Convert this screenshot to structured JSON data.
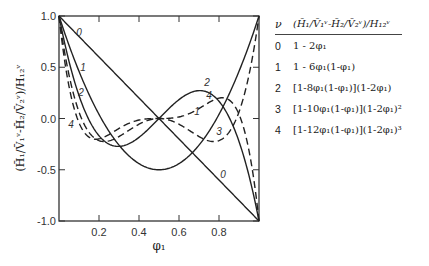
{
  "chart_data": {
    "type": "line",
    "title": "",
    "xlabel": "φ1",
    "ylabel": "(H̄1/V̄1^ν − H̄2/V̄2^ν)/H12^ν",
    "xlim": [
      0,
      1
    ],
    "ylim": [
      -1.0,
      1.0
    ],
    "x_ticks": [
      "0.2",
      "0.4",
      "0.6",
      "0.8"
    ],
    "y_ticks": [
      "1.0",
      "0.5",
      "0.0",
      "-0.5",
      "-1.0"
    ],
    "grid": false,
    "legend_position": "right (table)",
    "x": [
      0,
      0.05,
      0.1,
      0.15,
      0.2,
      0.25,
      0.3,
      0.35,
      0.4,
      0.45,
      0.5,
      0.55,
      0.6,
      0.65,
      0.7,
      0.75,
      0.8,
      0.85,
      0.9,
      0.95,
      1.0
    ],
    "series": [
      {
        "name": "0",
        "formula": "1 - 2φ1",
        "style": "solid",
        "values": [
          1.0,
          0.9,
          0.8,
          0.7,
          0.6,
          0.5,
          0.4,
          0.3,
          0.2,
          0.1,
          0.0,
          -0.1,
          -0.2,
          -0.3,
          -0.4,
          -0.5,
          -0.6,
          -0.7,
          -0.8,
          -0.9,
          -1.0
        ]
      },
      {
        "name": "1",
        "formula": "1 - 6φ1(1-φ1)",
        "style": "solid",
        "values": [
          1.0,
          0.715,
          0.46,
          0.235,
          0.04,
          -0.125,
          -0.26,
          -0.365,
          -0.44,
          -0.485,
          -0.5,
          -0.485,
          -0.44,
          -0.365,
          -0.26,
          -0.125,
          0.04,
          0.235,
          0.46,
          0.715,
          1.0
        ]
      },
      {
        "name": "2",
        "formula": "[1-8φ1(1-φ1)](1-2φ1)",
        "style": "solid",
        "values": [
          1.0,
          0.558,
          0.224,
          -0.014,
          -0.168,
          -0.25,
          -0.272,
          -0.246,
          -0.184,
          -0.098,
          0.0,
          0.098,
          0.184,
          0.246,
          0.272,
          0.25,
          0.168,
          0.014,
          -0.224,
          -0.558,
          -1.0
        ]
      },
      {
        "name": "3",
        "formula": "[1-10φ1(1-φ1)](1-2φ1)²",
        "style": "dashed",
        "values": [
          1.0,
          0.425,
          0.064,
          -0.134,
          -0.216,
          -0.219,
          -0.176,
          -0.111,
          -0.056,
          -0.012,
          0.0,
          -0.012,
          -0.056,
          -0.111,
          -0.176,
          -0.219,
          -0.216,
          -0.134,
          0.064,
          0.425,
          1.0
        ]
      },
      {
        "name": "4",
        "formula": "[1-12φ1(1-φ1)](1-2φ1)³",
        "style": "dashed",
        "values": [
          1.0,
          0.314,
          -0.041,
          -0.178,
          -0.199,
          -0.156,
          -0.099,
          -0.049,
          -0.016,
          -0.003,
          0.0,
          0.003,
          0.016,
          0.049,
          0.099,
          0.156,
          0.199,
          0.178,
          0.041,
          -0.314,
          -1.0
        ]
      }
    ]
  },
  "legend": {
    "header_nu": "ν",
    "header_expr": "(H̄₁/V̄₁ᵛ-H̄₂/V̄₂ᵛ)/H₁₂ᵛ",
    "rows": [
      {
        "nu": "0",
        "expr": "1 - 2φ₁"
      },
      {
        "nu": "1",
        "expr": "1 - 6φ₁(1-φ₁)"
      },
      {
        "nu": "2",
        "expr": "[1-8φ₁(1-φ₁)](1-2φ₁)"
      },
      {
        "nu": "3",
        "expr": "[1-10φ₁(1-φ₁)](1-2φ₁)²"
      },
      {
        "nu": "4",
        "expr": "[1-12φ₁(1-φ₁)](1-2φ₁)³"
      }
    ]
  },
  "axes": {
    "xlabel": "φ₁",
    "ylabel": "(H̄₁/V̄₁ᵛ-H̄₂/V̄₂ᵛ)/H₁₂ᵛ"
  }
}
